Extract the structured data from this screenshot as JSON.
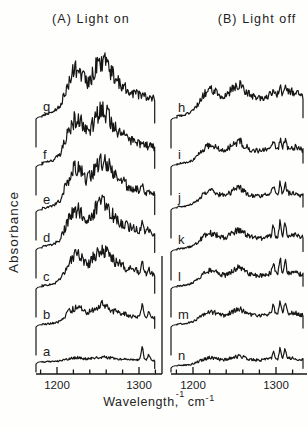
{
  "labels": {
    "panel_a_title": "(A) Light on",
    "panel_b_title": "(B) Light off",
    "ylabel": "Absorbance",
    "xlabel_word": "Wavelength",
    "xlabel_sup1": "-1",
    "xlabel_comma": ",",
    "xlabel_unit": "cm",
    "xlabel_sup2": "-1"
  },
  "chart_data": {
    "type": "line",
    "title": "",
    "xlabel": "Wavelength⁻¹, cm⁻¹",
    "ylabel": "Absorbance (arbitrary units, traces vertically offset)",
    "x_axis": {
      "unit": "cm⁻¹",
      "range": [
        1174,
        1333
      ],
      "ticks_major": [
        1200,
        1300
      ],
      "ticks_minor": [
        1180,
        1220,
        1240,
        1260,
        1280,
        1320
      ]
    },
    "grid": false,
    "legend": "none",
    "envelopes": {
      "broad_A": [
        [
          1173,
          0.02
        ],
        [
          1186,
          0.04
        ],
        [
          1196,
          0.09
        ],
        [
          1204,
          0.2
        ],
        [
          1210,
          0.45
        ],
        [
          1216,
          0.7
        ],
        [
          1222,
          0.84
        ],
        [
          1227,
          0.88
        ],
        [
          1231,
          0.72
        ],
        [
          1236,
          0.6
        ],
        [
          1241,
          0.66
        ],
        [
          1246,
          0.84
        ],
        [
          1252,
          0.98
        ],
        [
          1257,
          1.0
        ],
        [
          1262,
          0.9
        ],
        [
          1267,
          0.77
        ],
        [
          1272,
          0.64
        ],
        [
          1278,
          0.57
        ],
        [
          1284,
          0.51
        ],
        [
          1291,
          0.45
        ],
        [
          1298,
          0.41
        ],
        [
          1305,
          0.38
        ],
        [
          1312,
          0.35
        ],
        [
          1320,
          0.32
        ],
        [
          1328,
          0.3
        ]
      ],
      "broad_B": [
        [
          1174,
          0.03
        ],
        [
          1188,
          0.06
        ],
        [
          1198,
          0.13
        ],
        [
          1206,
          0.32
        ],
        [
          1214,
          0.56
        ],
        [
          1221,
          0.66
        ],
        [
          1227,
          0.6
        ],
        [
          1233,
          0.5
        ],
        [
          1239,
          0.48
        ],
        [
          1245,
          0.6
        ],
        [
          1251,
          0.72
        ],
        [
          1257,
          0.78
        ],
        [
          1263,
          0.62
        ],
        [
          1269,
          0.52
        ],
        [
          1275,
          0.47
        ],
        [
          1282,
          0.45
        ],
        [
          1289,
          0.5
        ],
        [
          1295,
          0.56
        ],
        [
          1300,
          0.5
        ],
        [
          1305,
          0.52
        ],
        [
          1310,
          0.55
        ],
        [
          1316,
          0.58
        ],
        [
          1322,
          0.6
        ],
        [
          1328,
          0.52
        ],
        [
          1336,
          0.46
        ]
      ]
    },
    "panels": [
      {
        "id": "A",
        "title": "(A) Light on",
        "curves": [
          {
            "label": "g",
            "envelope": "broad_A",
            "amplitude": 1.0,
            "spikes": []
          },
          {
            "label": "f",
            "envelope": "broad_A",
            "amplitude": 0.97,
            "spikes": []
          },
          {
            "label": "e",
            "envelope": "broad_A",
            "amplitude": 0.9,
            "spikes": [
              {
                "x": 1304,
                "h": 0.07
              }
            ]
          },
          {
            "label": "d",
            "envelope": "broad_A",
            "amplitude": 0.8,
            "spikes": [
              {
                "x": 1304,
                "h": 0.14
              },
              {
                "x": 1312,
                "h": 0.05
              }
            ]
          },
          {
            "label": "c",
            "envelope": "broad_A",
            "amplitude": 0.68,
            "spikes": [
              {
                "x": 1304,
                "h": 0.18
              },
              {
                "x": 1312,
                "h": 0.07
              }
            ]
          },
          {
            "label": "b",
            "envelope": "broad_A",
            "amplitude": 0.36,
            "spikes": [
              {
                "x": 1304,
                "h": 0.22
              },
              {
                "x": 1312,
                "h": 0.09
              }
            ]
          },
          {
            "label": "a",
            "envelope": "broad_A",
            "amplitude": 0.09,
            "spikes": [
              {
                "x": 1304,
                "h": 0.25
              },
              {
                "x": 1312,
                "h": 0.1
              }
            ]
          }
        ]
      },
      {
        "id": "B",
        "title": "(B) Light off",
        "curves": [
          {
            "label": "h",
            "envelope": "broad_B",
            "amplitude": 0.79,
            "spikes": [
              {
                "x": 1297,
                "h": 0.1
              },
              {
                "x": 1305,
                "h": 0.13
              },
              {
                "x": 1311,
                "h": 0.11
              }
            ]
          },
          {
            "label": "i",
            "envelope": "broad_B",
            "amplitude": 0.54,
            "spikes": [
              {
                "x": 1297,
                "h": 0.14
              },
              {
                "x": 1305,
                "h": 0.18
              },
              {
                "x": 1311,
                "h": 0.15
              }
            ]
          },
          {
            "label": "j",
            "envelope": "broad_B",
            "amplitude": 0.46,
            "spikes": [
              {
                "x": 1297,
                "h": 0.16
              },
              {
                "x": 1305,
                "h": 0.22
              },
              {
                "x": 1311,
                "h": 0.18
              }
            ]
          },
          {
            "label": "k",
            "envelope": "broad_B",
            "amplitude": 0.46,
            "spikes": [
              {
                "x": 1297,
                "h": 0.2
              },
              {
                "x": 1305,
                "h": 0.27
              },
              {
                "x": 1311,
                "h": 0.22
              }
            ]
          },
          {
            "label": "l",
            "envelope": "broad_B",
            "amplitude": 0.45,
            "spikes": [
              {
                "x": 1297,
                "h": 0.2
              },
              {
                "x": 1305,
                "h": 0.27
              },
              {
                "x": 1311,
                "h": 0.22
              }
            ]
          },
          {
            "label": "m",
            "envelope": "broad_B",
            "amplitude": 0.36,
            "spikes": [
              {
                "x": 1297,
                "h": 0.18
              },
              {
                "x": 1305,
                "h": 0.24
              },
              {
                "x": 1311,
                "h": 0.2
              }
            ]
          },
          {
            "label": "n",
            "envelope": "broad_B",
            "amplitude": 0.23,
            "spikes": [
              {
                "x": 1297,
                "h": 0.14
              },
              {
                "x": 1305,
                "h": 0.2
              },
              {
                "x": 1311,
                "h": 0.16
              }
            ]
          }
        ]
      }
    ],
    "note": "Envelope values are relative absorbance (0-1) of each trace above its own offset baseline"
  }
}
